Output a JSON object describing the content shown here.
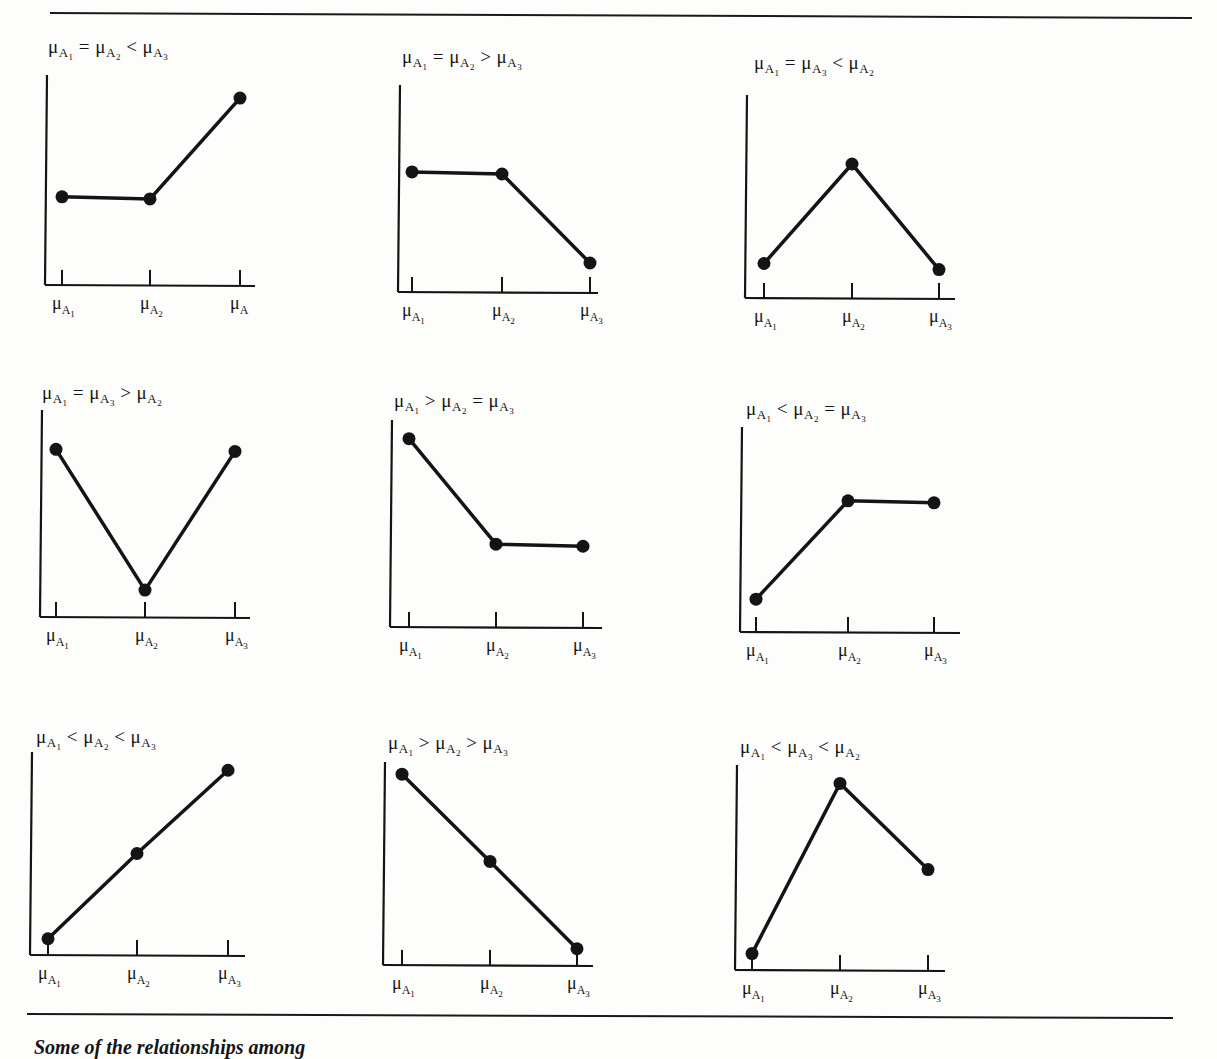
{
  "figure": {
    "caption": "Some of the relationships among",
    "panels": [
      {
        "title": [
          "μ",
          "A1",
          " = ",
          "μ",
          "A2",
          " < ",
          "μ",
          "A3"
        ],
        "title_text": "μA1 = μA2 < μA3",
        "x_labels": [
          "μA1",
          "μA2",
          "μA"
        ]
      },
      {
        "title_text": "μA1 = μA2 > μA3",
        "x_labels": [
          "μA1",
          "μA2",
          "μA3"
        ]
      },
      {
        "title_text": "μA1 = μA3 < μA2",
        "x_labels": [
          "μA1",
          "μA2",
          "μA3"
        ]
      },
      {
        "title_text": "μA1 = μA3 > μA2",
        "x_labels": [
          "μA1",
          "μA2",
          "μA3"
        ]
      },
      {
        "title_text": "μA1 > μA2 = μA3",
        "x_labels": [
          "μA1",
          "μA2",
          "μA3"
        ]
      },
      {
        "title_text": "μA1 < μA2 = μA3",
        "x_labels": [
          "μA1",
          "μA2",
          "μA3"
        ]
      },
      {
        "title_text": "μA1 < μA2 < μA3",
        "x_labels": [
          "μA1",
          "μA2",
          "μA3"
        ]
      },
      {
        "title_text": "μA1 > μA2 > μA3",
        "x_labels": [
          "μA1",
          "μA2",
          "μA3"
        ]
      },
      {
        "title_text": "μA1 < μA3 < μA2",
        "x_labels": [
          "μA1",
          "μA2",
          "μA3"
        ]
      }
    ]
  },
  "colors": {
    "ink": "#141414",
    "paper": "#fdfdfb"
  },
  "chart_data": [
    {
      "type": "line",
      "title": "μA1 = μA2 < μA3",
      "categories": [
        "μA1",
        "μA2",
        "μA"
      ],
      "values": [
        0.42,
        0.41,
        0.89
      ],
      "ylim": [
        0,
        1
      ],
      "grid": false,
      "xlabel": "",
      "ylabel": ""
    },
    {
      "type": "line",
      "title": "μA1 = μA2 > μA3",
      "categories": [
        "μA1",
        "μA2",
        "μA3"
      ],
      "values": [
        0.58,
        0.57,
        0.14
      ],
      "ylim": [
        0,
        1
      ],
      "grid": false,
      "xlabel": "",
      "ylabel": ""
    },
    {
      "type": "line",
      "title": "μA1 = μA3 < μA2",
      "categories": [
        "μA1",
        "μA2",
        "μA3"
      ],
      "values": [
        0.17,
        0.66,
        0.14
      ],
      "ylim": [
        0,
        1
      ],
      "grid": false,
      "xlabel": "",
      "ylabel": ""
    },
    {
      "type": "line",
      "title": "μA1 = μA3 > μA2",
      "categories": [
        "μA1",
        "μA2",
        "μA3"
      ],
      "values": [
        0.81,
        0.13,
        0.8
      ],
      "ylim": [
        0,
        1
      ],
      "grid": false,
      "xlabel": "",
      "ylabel": ""
    },
    {
      "type": "line",
      "title": "μA1 > μA2 = μA3",
      "categories": [
        "μA1",
        "μA2",
        "μA3"
      ],
      "values": [
        0.91,
        0.4,
        0.39
      ],
      "ylim": [
        0,
        1
      ],
      "grid": false,
      "xlabel": "",
      "ylabel": ""
    },
    {
      "type": "line",
      "title": "μA1 < μA2 = μA3",
      "categories": [
        "μA1",
        "μA2",
        "μA3"
      ],
      "values": [
        0.16,
        0.64,
        0.63
      ],
      "ylim": [
        0,
        1
      ],
      "grid": false,
      "xlabel": "",
      "ylabel": ""
    },
    {
      "type": "line",
      "title": "μA1 < μA2 < μA3",
      "categories": [
        "μA1",
        "μA2",
        "μA3"
      ],
      "values": [
        0.08,
        0.5,
        0.91
      ],
      "ylim": [
        0,
        1
      ],
      "grid": false,
      "xlabel": "",
      "ylabel": ""
    },
    {
      "type": "line",
      "title": "μA1 > μA2 > μA3",
      "categories": [
        "μA1",
        "μA2",
        "μA3"
      ],
      "values": [
        0.94,
        0.51,
        0.08
      ],
      "ylim": [
        0,
        1
      ],
      "grid": false,
      "xlabel": "",
      "ylabel": ""
    },
    {
      "type": "line",
      "title": "μA1 < μA3 < μA2",
      "categories": [
        "μA1",
        "μA2",
        "μA3"
      ],
      "values": [
        0.08,
        0.91,
        0.49
      ],
      "ylim": [
        0,
        1
      ],
      "grid": false,
      "xlabel": "",
      "ylabel": ""
    }
  ]
}
